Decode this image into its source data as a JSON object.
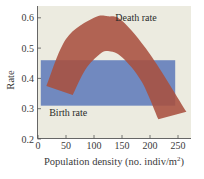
{
  "chart_data": {
    "type": "area",
    "title": "",
    "xlabel": "Population density (no. indiv/m",
    "xlabel_sup": "2",
    "xlabel_close": ")",
    "ylabel": "Rate",
    "xlim": [
      0,
      270
    ],
    "ylim": [
      0.2,
      0.63
    ],
    "xticks": [
      0,
      50,
      100,
      150,
      200,
      250
    ],
    "xtick_labels": [
      "0",
      "50",
      "100",
      "150",
      "200",
      "250"
    ],
    "yticks": [
      0.2,
      0.3,
      0.4,
      0.5,
      0.6
    ],
    "ytick_labels": [
      "0.2",
      "0.3",
      "0.4",
      "0.5",
      "0.6"
    ],
    "grid": false,
    "background_color": "#ecebe0",
    "series": [
      {
        "name": "Birth rate",
        "shape": "band",
        "color": "#7189bf",
        "x_range": [
          5,
          245
        ],
        "y_range": [
          0.31,
          0.46
        ],
        "label_position": {
          "x": 20,
          "y": 0.285
        }
      },
      {
        "name": "Death rate",
        "shape": "arc-band",
        "color": "#a9503f",
        "outer_curve": [
          {
            "x": 15,
            "y": 0.375
          },
          {
            "x": 50,
            "y": 0.53
          },
          {
            "x": 100,
            "y": 0.6
          },
          {
            "x": 125,
            "y": 0.605
          },
          {
            "x": 150,
            "y": 0.59
          },
          {
            "x": 200,
            "y": 0.48
          },
          {
            "x": 265,
            "y": 0.29
          }
        ],
        "inner_curve": [
          {
            "x": 62,
            "y": 0.345
          },
          {
            "x": 85,
            "y": 0.43
          },
          {
            "x": 110,
            "y": 0.48
          },
          {
            "x": 125,
            "y": 0.49
          },
          {
            "x": 150,
            "y": 0.47
          },
          {
            "x": 185,
            "y": 0.39
          },
          {
            "x": 215,
            "y": 0.265
          }
        ],
        "label_position": {
          "x": 175,
          "y": 0.6
        }
      }
    ]
  }
}
